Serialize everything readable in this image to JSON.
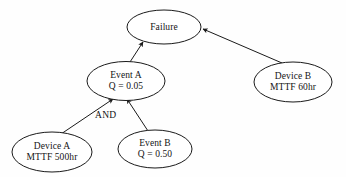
{
  "diagram": {
    "type": "fault-tree",
    "background_color": "#fefefe",
    "stroke_color": "#1a1a1a",
    "text_color": "#141414",
    "nodes": [
      {
        "id": "failure",
        "name": "failure-node",
        "line1": "Failure",
        "line2": "",
        "cx": 164,
        "cy": 27,
        "rx": 37,
        "ry": 17
      },
      {
        "id": "event-a",
        "name": "event-a-node",
        "line1": "Event A",
        "line2": "Q = 0.05",
        "cx": 126,
        "cy": 81,
        "rx": 39,
        "ry": 19.5
      },
      {
        "id": "device-b",
        "name": "device-b-node",
        "line1": "Device B",
        "line2": "MTTF 60hr",
        "cx": 293,
        "cy": 82,
        "rx": 39,
        "ry": 20
      },
      {
        "id": "device-a",
        "name": "device-a-node",
        "line1": "Device A",
        "line2": "MTTF 500hr",
        "cx": 52,
        "cy": 152,
        "rx": 40,
        "ry": 20
      },
      {
        "id": "event-b",
        "name": "event-b-node",
        "line1": "Event B",
        "line2": "Q = 0.50",
        "cx": 155,
        "cy": 149,
        "rx": 37,
        "ry": 19
      }
    ],
    "gate_label": "AND",
    "gate_label_x": 95,
    "gate_label_y": 110,
    "edges": [
      {
        "id": "event-a-to-failure",
        "name": "edge-event-a-to-failure",
        "from": "event-a",
        "to": "failure",
        "x1": 130,
        "y1": 62,
        "x2": 143,
        "y2": 42
      },
      {
        "id": "device-b-to-failure",
        "name": "edge-device-b-to-failure",
        "from": "device-b",
        "to": "failure",
        "x1": 282,
        "y1": 63,
        "x2": 203,
        "y2": 29
      },
      {
        "id": "device-a-to-event-a",
        "name": "edge-device-a-to-event-a",
        "from": "device-a",
        "to": "event-a",
        "x1": 61,
        "y1": 134,
        "x2": 113,
        "y2": 99
      },
      {
        "id": "event-b-to-event-a",
        "name": "edge-event-b-to-event-a",
        "from": "event-b",
        "to": "event-a",
        "x1": 148,
        "y1": 131,
        "x2": 127,
        "y2": 99
      }
    ]
  }
}
